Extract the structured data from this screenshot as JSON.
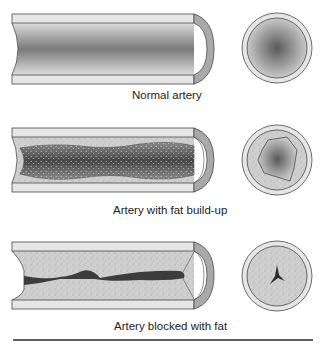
{
  "panels": [
    {
      "id": "normal",
      "label": "Normal artery"
    },
    {
      "id": "buildup",
      "label": "Artery with fat build-up"
    },
    {
      "id": "blocked",
      "label": "Artery blocked with fat"
    }
  ],
  "colors": {
    "wall": "#e6e6e6",
    "wall_cap": "#a9a9a9",
    "lumen_dark": "#7a7a7a",
    "lumen_light": "#d4d4d4",
    "plaque": "#cfcfcf",
    "fat_dark": "#3c3c3c",
    "outline": "#4a4a4a",
    "rule": "#2a2a2a"
  }
}
